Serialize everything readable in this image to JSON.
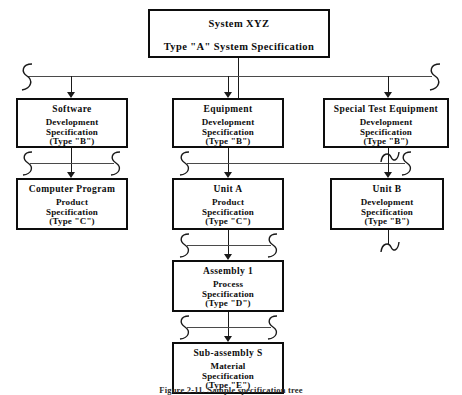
{
  "figure": {
    "caption": "Figure 2-11.  Sample specification tree"
  },
  "nodes": {
    "system": {
      "title": "System XYZ",
      "subtitle": "Type \"A\" System Specification"
    },
    "software": {
      "title": "Software",
      "spec_line1": "Development",
      "spec_line2": "Specification",
      "spec_line3": "(Type  \"B\")"
    },
    "equipment": {
      "title": "Equipment",
      "spec_line1": "Development",
      "spec_line2": "Specification",
      "spec_line3": "(Type  \"B\")"
    },
    "special_test_equipment": {
      "title": "Special Test Equipment",
      "spec_line1": "Development",
      "spec_line2": "Specification",
      "spec_line3": "(Type  \"B\")"
    },
    "computer_program": {
      "title": "Computer  Program",
      "spec_line1": "Product",
      "spec_line2": "Specification",
      "spec_line3": "(Type  \"C\")"
    },
    "unit_a": {
      "title": "Unit A",
      "spec_line1": "Product",
      "spec_line2": "Specification",
      "spec_line3": "(Type  \"C\")"
    },
    "unit_b": {
      "title": "Unit  B",
      "spec_line1": "Development",
      "spec_line2": "Specification",
      "spec_line3": "(Type  \"B\")"
    },
    "assembly_1": {
      "title": "Assembly  1",
      "spec_line1": "Process",
      "spec_line2": "Specification",
      "spec_line3": "(Type  \"D\")"
    },
    "subassembly_s": {
      "title": "Sub-assembly  S",
      "spec_line1": "Material",
      "spec_line2": "Specification",
      "spec_line3": "(Type  \"E\")"
    }
  },
  "colors": {
    "box_border": "#0d0d0d",
    "connector": "#1a1a1a",
    "bus": "#4a4a4a",
    "background": "#ffffff",
    "text": "#0d0d0d"
  }
}
